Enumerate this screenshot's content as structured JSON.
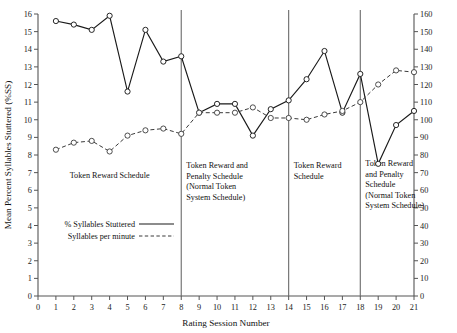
{
  "chart_data": {
    "type": "line",
    "title": "",
    "xlabel": "Rating Session Number",
    "ylabel": "Mean Percent Syllables Stuttered (%SS)",
    "ylabel_right": "",
    "x": [
      1,
      2,
      3,
      4,
      5,
      6,
      7,
      8,
      9,
      10,
      11,
      12,
      13,
      14,
      15,
      16,
      17,
      18,
      19,
      20,
      21
    ],
    "xlim": [
      0,
      21
    ],
    "xticks": [
      "0",
      "1",
      "2",
      "3",
      "4",
      "5",
      "6",
      "7",
      "8",
      "9",
      "10",
      "11",
      "12",
      "13",
      "14",
      "15",
      "16",
      "17",
      "18",
      "19",
      "20",
      "21"
    ],
    "ylim": [
      0,
      16
    ],
    "yticks": [
      "0",
      "1",
      "2",
      "3",
      "4",
      "5",
      "6",
      "7",
      "8",
      "9",
      "10",
      "11",
      "12",
      "13",
      "14",
      "15",
      "16"
    ],
    "ylim_right": [
      0,
      160
    ],
    "yticks_right": [
      "0",
      "10",
      "20",
      "30",
      "40",
      "50",
      "60",
      "70",
      "80",
      "90",
      "100",
      "110",
      "120",
      "130",
      "140",
      "150",
      "160"
    ],
    "grid": false,
    "legend_position": "lower-left",
    "series": [
      {
        "name": "% Syllables Stuttered",
        "axis": "left",
        "style": "solid",
        "values": [
          15.6,
          15.4,
          15.1,
          15.9,
          11.6,
          15.1,
          13.3,
          13.6,
          10.4,
          10.9,
          10.9,
          9.1,
          10.6,
          11.1,
          12.3,
          13.9,
          10.4,
          12.6,
          7.5,
          9.7,
          10.5
        ]
      },
      {
        "name": "Syllables per minute",
        "axis": "right",
        "style": "dashed",
        "values": [
          83,
          87,
          88,
          82,
          91,
          94,
          95,
          92,
          104,
          104,
          104,
          107,
          101,
          101,
          100,
          103,
          105,
          110,
          120,
          128,
          127
        ]
      }
    ],
    "phase_dividers": [
      8,
      14,
      18
    ],
    "phases": [
      {
        "label": "Token Reward Schedule",
        "start": 0,
        "end": 8,
        "lines": [
          "Token Reward Schedule"
        ]
      },
      {
        "label": "Token Reward and Penalty Schedule (Normal Token System Schedule)",
        "start": 8,
        "end": 14,
        "lines": [
          "Token Reward and",
          "Penalty Schedule",
          "(Normal Token",
          "System Schedule)"
        ]
      },
      {
        "label": "Token Reward Schedule",
        "start": 14,
        "end": 18,
        "lines": [
          "Token Reward",
          "Schedule"
        ]
      },
      {
        "label": "Token Reward and Penalty Schedule (Normal Token System Schedule)",
        "start": 18,
        "end": 21,
        "lines": [
          "Token Reward",
          "and Penalty",
          "Schedule",
          "(Normal Token",
          "System Schedule)"
        ]
      }
    ],
    "legend": [
      {
        "label": "% Syllables Stuttered",
        "style": "solid"
      },
      {
        "label": "Syllables per minute",
        "style": "dashed"
      }
    ],
    "colors": {
      "solid_line": "#1a1a1a",
      "dashed_line": "#3a3a3a",
      "axis": "#555555",
      "divider": "#6a6a6a",
      "background": "#ffffff"
    }
  }
}
